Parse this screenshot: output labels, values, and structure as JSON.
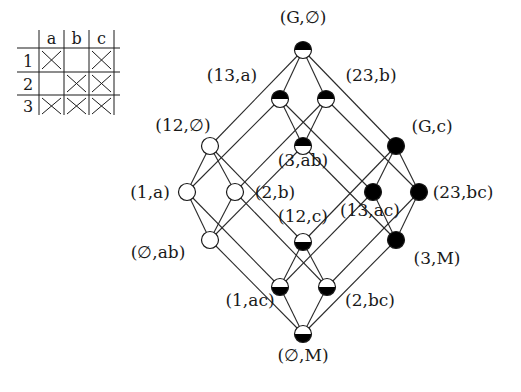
{
  "context_table": {
    "columns": [
      "a",
      "b",
      "c"
    ],
    "rows": [
      {
        "label": "1",
        "cells": [
          true,
          false,
          true
        ]
      },
      {
        "label": "2",
        "cells": [
          false,
          true,
          true
        ]
      },
      {
        "label": "3",
        "cells": [
          true,
          true,
          true
        ]
      }
    ]
  },
  "lattice": {
    "nodes": [
      {
        "id": "G_empty",
        "label": "(G,∅)",
        "x": 303,
        "y": 50,
        "fill": "top-half-black",
        "lx": 303,
        "ly": 23,
        "anchor": "middle"
      },
      {
        "id": "13_a",
        "label": "(13,a)",
        "x": 280,
        "y": 99,
        "fill": "top-half-black",
        "lx": 232,
        "ly": 81,
        "anchor": "middle"
      },
      {
        "id": "23_b",
        "label": "(23,b)",
        "x": 326,
        "y": 99,
        "fill": "top-half-black",
        "lx": 371,
        "ly": 81,
        "anchor": "middle"
      },
      {
        "id": "12_empty",
        "label": "(12,∅)",
        "x": 210,
        "y": 146,
        "fill": "white",
        "lx": 183,
        "ly": 131,
        "anchor": "middle"
      },
      {
        "id": "3_ab",
        "label": "(3,ab)",
        "x": 303,
        "y": 146,
        "fill": "top-half-black",
        "lx": 303,
        "ly": 166,
        "anchor": "middle"
      },
      {
        "id": "G_c",
        "label": "(G,c)",
        "x": 396,
        "y": 146,
        "fill": "black",
        "lx": 432,
        "ly": 132,
        "anchor": "middle"
      },
      {
        "id": "1_a",
        "label": "(1,a)",
        "x": 187,
        "y": 192,
        "fill": "white",
        "lx": 150,
        "ly": 198,
        "anchor": "middle"
      },
      {
        "id": "2_b",
        "label": "(2,b)",
        "x": 235,
        "y": 192,
        "fill": "white",
        "lx": 275,
        "ly": 198,
        "anchor": "middle"
      },
      {
        "id": "13_ac",
        "label": "(13,ac)",
        "x": 373,
        "y": 192,
        "fill": "black",
        "lx": 370,
        "ly": 216,
        "anchor": "middle"
      },
      {
        "id": "23_bc",
        "label": "(23,bc)",
        "x": 419,
        "y": 192,
        "fill": "black",
        "lx": 463,
        "ly": 198,
        "anchor": "middle"
      },
      {
        "id": "empty_ab",
        "label": "(∅,ab)",
        "x": 210,
        "y": 240,
        "fill": "white",
        "lx": 158,
        "ly": 258,
        "anchor": "middle"
      },
      {
        "id": "12_c",
        "label": "(12,c)",
        "x": 303,
        "y": 242,
        "fill": "bottom-half-black",
        "lx": 303,
        "ly": 222,
        "anchor": "middle"
      },
      {
        "id": "3_M",
        "label": "(3,M)",
        "x": 396,
        "y": 240,
        "fill": "black",
        "lx": 437,
        "ly": 264,
        "anchor": "middle"
      },
      {
        "id": "1_ac",
        "label": "(1,ac)",
        "x": 280,
        "y": 287,
        "fill": "bottom-half-black",
        "lx": 250,
        "ly": 306,
        "anchor": "middle"
      },
      {
        "id": "2_bc",
        "label": "(2,bc)",
        "x": 327,
        "y": 287,
        "fill": "bottom-half-black",
        "lx": 370,
        "ly": 306,
        "anchor": "middle"
      },
      {
        "id": "empty_M",
        "label": "(∅,M)",
        "x": 303,
        "y": 334,
        "fill": "bottom-half-black",
        "lx": 303,
        "ly": 361,
        "anchor": "middle"
      }
    ],
    "edges": [
      [
        "G_empty",
        "12_empty"
      ],
      [
        "G_empty",
        "13_a"
      ],
      [
        "G_empty",
        "23_b"
      ],
      [
        "G_empty",
        "G_c"
      ],
      [
        "12_empty",
        "1_a"
      ],
      [
        "12_empty",
        "2_b"
      ],
      [
        "12_empty",
        "12_c"
      ],
      [
        "13_a",
        "1_a"
      ],
      [
        "13_a",
        "3_ab"
      ],
      [
        "13_a",
        "13_ac"
      ],
      [
        "23_b",
        "2_b"
      ],
      [
        "23_b",
        "3_ab"
      ],
      [
        "23_b",
        "23_bc"
      ],
      [
        "G_c",
        "12_c"
      ],
      [
        "G_c",
        "13_ac"
      ],
      [
        "G_c",
        "23_bc"
      ],
      [
        "1_a",
        "empty_ab"
      ],
      [
        "1_a",
        "1_ac"
      ],
      [
        "2_b",
        "empty_ab"
      ],
      [
        "2_b",
        "2_bc"
      ],
      [
        "3_ab",
        "empty_ab"
      ],
      [
        "3_ab",
        "3_M"
      ],
      [
        "12_c",
        "1_ac"
      ],
      [
        "12_c",
        "2_bc"
      ],
      [
        "13_ac",
        "1_ac"
      ],
      [
        "13_ac",
        "3_M"
      ],
      [
        "23_bc",
        "2_bc"
      ],
      [
        "23_bc",
        "3_M"
      ],
      [
        "empty_ab",
        "empty_M"
      ],
      [
        "1_ac",
        "empty_M"
      ],
      [
        "2_bc",
        "empty_M"
      ],
      [
        "3_M",
        "empty_M"
      ]
    ],
    "node_radius": 8.5
  },
  "colors": {
    "ink": "#1a1a1a",
    "paper": "#ffffff"
  }
}
